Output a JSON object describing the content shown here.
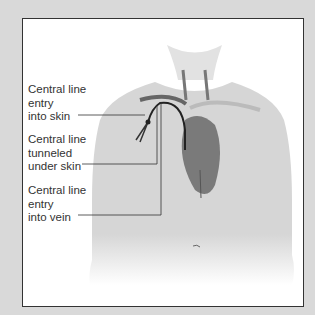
{
  "labels": {
    "entry_skin": [
      "Central line",
      "entry",
      "into skin"
    ],
    "tunneled": [
      "Central line",
      "tunneled",
      "under skin"
    ],
    "entry_vein": [
      "Central line",
      "entry",
      "into vein"
    ]
  },
  "colors": {
    "background": "#d9d9d9",
    "frame_border": "#333333",
    "body": "#dcdcdc",
    "heart": "#7a7a7a",
    "catheter": "#222222"
  }
}
